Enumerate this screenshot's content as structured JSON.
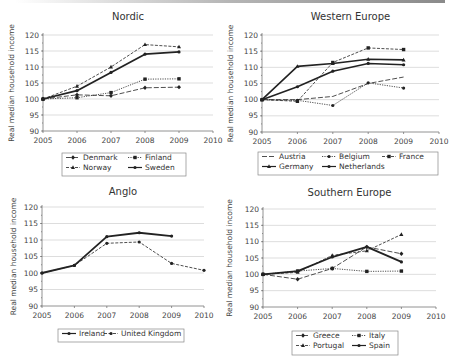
{
  "figure": {
    "ylabel": "Real median household income"
  },
  "chart_data": [
    {
      "type": "line",
      "title": "Nordic",
      "xlabel": "",
      "ylabel": "Real median household income",
      "x": [
        2005,
        2006,
        2007,
        2008,
        2009
      ],
      "xticks": [
        2005,
        2006,
        2007,
        2008,
        2009,
        2010
      ],
      "yticks": [
        90,
        95,
        100,
        105,
        110,
        115,
        120
      ],
      "ylim": [
        90,
        120
      ],
      "xlim": [
        2005,
        2010
      ],
      "grid": true,
      "legend_position": "bottom",
      "series": [
        {
          "name": "Denmark",
          "values": [
            100,
            101.3,
            101,
            103.5,
            103.7
          ],
          "style": "longdash",
          "marker": "diamond",
          "width": 0.8
        },
        {
          "name": "Finland",
          "values": [
            100,
            100.4,
            102,
            106.2,
            106.3
          ],
          "style": "dot",
          "marker": "square",
          "width": 0.8
        },
        {
          "name": "Norway",
          "values": [
            100,
            104,
            110,
            117,
            116.3
          ],
          "style": "dash",
          "marker": "triangle",
          "width": 0.8
        },
        {
          "name": "Sweden",
          "values": [
            100,
            102.6,
            108.3,
            114,
            114.7
          ],
          "style": "solid",
          "marker": "circle",
          "width": 1.8
        }
      ]
    },
    {
      "type": "line",
      "title": "Western Europe",
      "xlabel": "",
      "ylabel": "Real median household income",
      "x": [
        2005,
        2006,
        2007,
        2008,
        2009
      ],
      "xticks": [
        2005,
        2006,
        2007,
        2008,
        2009,
        2010
      ],
      "yticks": [
        90,
        95,
        100,
        105,
        110,
        115,
        120
      ],
      "ylim": [
        90,
        120
      ],
      "xlim": [
        2005,
        2010
      ],
      "grid": true,
      "legend_position": "bottom",
      "series": [
        {
          "name": "Austria",
          "values": [
            100,
            100,
            101,
            105,
            107
          ],
          "style": "longdash",
          "marker": "none",
          "width": 0.8
        },
        {
          "name": "Belgium",
          "values": [
            100,
            99.8,
            98.2,
            105.2,
            103.6
          ],
          "style": "dot",
          "marker": "circle",
          "width": 0.8
        },
        {
          "name": "France",
          "values": [
            100,
            99.5,
            111.5,
            116,
            115.5
          ],
          "style": "dash",
          "marker": "square",
          "width": 0.8
        },
        {
          "name": "Germany",
          "values": [
            100,
            110.3,
            111.2,
            112.5,
            112.3
          ],
          "style": "solid",
          "marker": "triangle",
          "width": 1.6
        },
        {
          "name": "Netherlands",
          "values": [
            100,
            104,
            108.8,
            111.2,
            110.8
          ],
          "style": "solid",
          "marker": "circle",
          "width": 1.6
        }
      ]
    },
    {
      "type": "line",
      "title": "Anglo",
      "xlabel": "",
      "ylabel": "Real median household income",
      "x": [
        2005,
        2006,
        2007,
        2008,
        2009,
        2010
      ],
      "xticks": [
        2005,
        2006,
        2007,
        2008,
        2009,
        2010
      ],
      "yticks": [
        90,
        95,
        100,
        105,
        110,
        115,
        120
      ],
      "ylim": [
        90,
        120
      ],
      "xlim": [
        2005,
        2010
      ],
      "grid": true,
      "legend_position": "bottom",
      "series": [
        {
          "name": "Ireland",
          "values": [
            100,
            102.3,
            111,
            112.2,
            111.2,
            null
          ],
          "style": "solid",
          "marker": "circle",
          "width": 1.8
        },
        {
          "name": "United Kingdom",
          "values": [
            100,
            102.3,
            109,
            109.4,
            102.9,
            100.8
          ],
          "style": "dash",
          "marker": "circle",
          "width": 0.8
        }
      ]
    },
    {
      "type": "line",
      "title": "Southern Europe",
      "xlabel": "",
      "ylabel": "Real median household income",
      "x": [
        2005,
        2006,
        2007,
        2008,
        2009
      ],
      "xticks": [
        2005,
        2006,
        2007,
        2008,
        2009,
        2010
      ],
      "yticks": [
        90,
        95,
        100,
        105,
        110,
        115,
        120
      ],
      "ylim": [
        90,
        120
      ],
      "xlim": [
        2005,
        2010
      ],
      "grid": true,
      "legend_position": "bottom",
      "series": [
        {
          "name": "Greece",
          "values": [
            100,
            98.5,
            101.8,
            108.4,
            106.3
          ],
          "style": "longdash",
          "marker": "diamond",
          "width": 0.8
        },
        {
          "name": "Italy",
          "values": [
            100,
            101,
            101.8,
            100.9,
            101
          ],
          "style": "dot",
          "marker": "square",
          "width": 0.8
        },
        {
          "name": "Portugal",
          "values": [
            100,
            100.6,
            105.8,
            107.2,
            112.2
          ],
          "style": "dash",
          "marker": "triangle",
          "width": 0.8
        },
        {
          "name": "Spain",
          "values": [
            100,
            101,
            105.3,
            108.4,
            103.8
          ],
          "style": "solid",
          "marker": "circle",
          "width": 1.8
        }
      ]
    }
  ]
}
